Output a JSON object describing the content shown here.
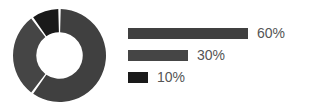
{
  "chart_data": {
    "type": "pie",
    "variant": "donut",
    "title": "",
    "subtitle": "",
    "xlabel": "",
    "ylabel": "",
    "grid": false,
    "legend_position": "right",
    "hole_ratio": 0.5,
    "gap_degrees": 3,
    "start_angle_degrees": -90,
    "direction": "clockwise",
    "categories": [
      "60%",
      "30%",
      "10%"
    ],
    "values": [
      60,
      30,
      10
    ],
    "labels": [
      "60%",
      "30%",
      "10%"
    ],
    "colors": [
      "#404040",
      "#454545",
      "#1a1a1a"
    ],
    "slices": [
      {
        "label": "60%",
        "value": 60,
        "color": "#404040"
      },
      {
        "label": "30%",
        "value": 30,
        "color": "#454545"
      },
      {
        "label": "10%",
        "value": 10,
        "color": "#1a1a1a"
      }
    ]
  },
  "legend": {
    "items": [
      {
        "label": "60%",
        "value": 60,
        "color": "#404040",
        "bar_width_px": 120
      },
      {
        "label": "30%",
        "value": 30,
        "color": "#454545",
        "bar_width_px": 60
      },
      {
        "label": "10%",
        "value": 10,
        "color": "#1a1a1a",
        "bar_width_px": 20
      }
    ]
  },
  "colors": {
    "background": "#ffffff",
    "gap": "#ffffff",
    "label_text": "#555555",
    "primary": "#404040",
    "secondary": "#454545",
    "accent_dark": "#1a1a1a"
  }
}
